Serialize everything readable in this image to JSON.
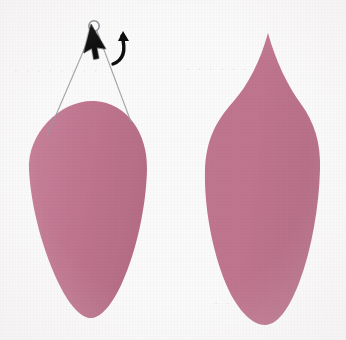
{
  "canvas": {
    "width": 346,
    "height": 340,
    "background_color": "#fbfafa",
    "media": "scanned-page"
  },
  "palette": {
    "shape_fill": "#bf748e",
    "shape_fill_shadow": "#b26a83",
    "shape_fill_highlight": "#c8819a",
    "cursor_black": "#111111",
    "handle_line": "#9a9aa2",
    "handle_circle_stroke": "#8d8d96",
    "ghost_text": "#ded4d8",
    "background": "#fbfafa"
  },
  "shapes": [
    {
      "id": "shape-left",
      "name": "inverted-teardrop-shape",
      "label": "Left shape",
      "form": "inverted teardrop / egg",
      "fill": "#bf748e",
      "bbox": {
        "x": 28,
        "y": 100,
        "width": 120,
        "height": 220
      },
      "path": "M 95 101 C 127 103 148 133 147 170 C 146 206 137 250 122 283 C 113 303 102 317 92 318 C 82 319 70 306 60 286 C 43 252 31 207 29 170 C 27 132 62 99 95 101 Z"
    },
    {
      "id": "shape-right",
      "name": "flame-leaf-shape",
      "label": "Right shape",
      "form": "flame / pointed leaf",
      "fill": "#bf748e",
      "bbox": {
        "x": 204,
        "y": 33,
        "width": 117,
        "height": 293
      },
      "path": "M 268 33 C 276 62 288 86 301 104 C 314 122 321 142 320 170 C 319 205 312 249 299 283 C 290 306 279 324 266 325 C 252 326 236 308 226 284 C 212 250 204 206 205 170 C 206 140 216 121 233 102 C 248 85 260 62 268 33 Z"
    }
  ],
  "overlay": {
    "name": "rotation-handle-overlay",
    "target_shape": "shape-left",
    "handle": {
      "name": "rotation-handle-circle",
      "cx": 94,
      "cy": 26,
      "r": 5.2,
      "stroke": "#8d8d96",
      "fill": "#ffffff"
    },
    "tether_lines": [
      {
        "name": "tether-line-left",
        "x1": 92,
        "y1": 31,
        "x2": 47,
        "y2": 136
      },
      {
        "name": "tether-line-right",
        "x1": 97,
        "y1": 31,
        "x2": 131,
        "y2": 122
      }
    ],
    "cursor": {
      "name": "mouse-pointer-arrow",
      "tip_x": 91,
      "tip_y": 24,
      "color": "#111111",
      "rotation_deg": 14
    },
    "rotate_arrow": {
      "name": "curved-rotate-arrow",
      "color": "#111111",
      "direction": "counter-clockwise",
      "path": "M 122 36 C 126 50 124 60 113 64"
    }
  },
  "ghost_text": {
    "row_1": "· · · · · · · ·",
    "row_2": "· · · · · · · ·",
    "row_3": "· · · · · ·",
    "row_4": "· · · · ·"
  }
}
